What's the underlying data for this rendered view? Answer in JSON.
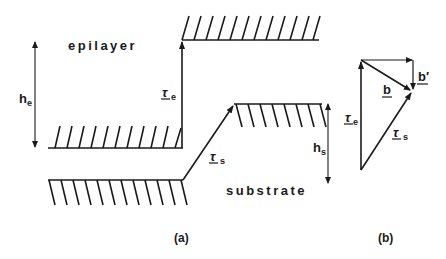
{
  "figure": {
    "panel_a": {
      "caption": "(a)",
      "region_labels": {
        "epilayer": "epilayer",
        "substrate": "substrate"
      },
      "vectors": {
        "tau_e": {
          "symbol": "τ",
          "subscript": "e"
        },
        "tau_s": {
          "symbol": "τ",
          "subscript": "s"
        }
      },
      "heights": {
        "h_e": {
          "symbol": "h",
          "subscript": "e"
        },
        "h_s": {
          "symbol": "h",
          "subscript": "s"
        }
      }
    },
    "panel_b": {
      "caption": "(b)",
      "vectors": {
        "tau_e": {
          "symbol": "τ",
          "subscript": "e"
        },
        "tau_s": {
          "symbol": "τ",
          "subscript": "s"
        },
        "b": {
          "symbol": "b"
        },
        "b_prime": {
          "symbol": "b′"
        }
      }
    },
    "colors": {
      "ink": "#1a1a1a",
      "background": "#ffffff"
    }
  }
}
